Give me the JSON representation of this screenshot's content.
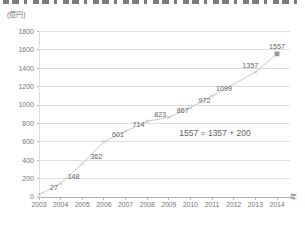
{
  "chart_data": {
    "type": "line",
    "title": "",
    "ylabel": "(億円)",
    "xlabel": "年",
    "categories": [
      2003,
      2004,
      2005,
      2006,
      2007,
      2008,
      2009,
      2010,
      2011,
      2012,
      2013,
      2014
    ],
    "series": [
      {
        "name": "",
        "values": [
          27,
          148,
          362,
          601,
          714,
          823,
          867,
          972,
          1099,
          null,
          1357,
          1557
        ]
      }
    ],
    "data_labels": [
      "27",
      "148",
      "362",
      "601",
      "714",
      "823",
      "867",
      "972",
      "1099",
      "",
      "1357",
      "1557"
    ],
    "annotation": "1557 = 1357 + 200",
    "ylim": [
      0,
      1800
    ],
    "yticks": [
      0,
      200,
      400,
      600,
      800,
      1000,
      1200,
      1400,
      1600,
      1800
    ],
    "grid": true,
    "legend": "none",
    "last_point_marker": "square",
    "colors": {
      "line": "#c9c9c9",
      "point_marker": "#bdbdbd",
      "last_marker": "#9a9a9a",
      "grid": "#dedede",
      "axis": "#b3b3b3",
      "tick_text": "#757575",
      "label_text": "#636363"
    }
  }
}
